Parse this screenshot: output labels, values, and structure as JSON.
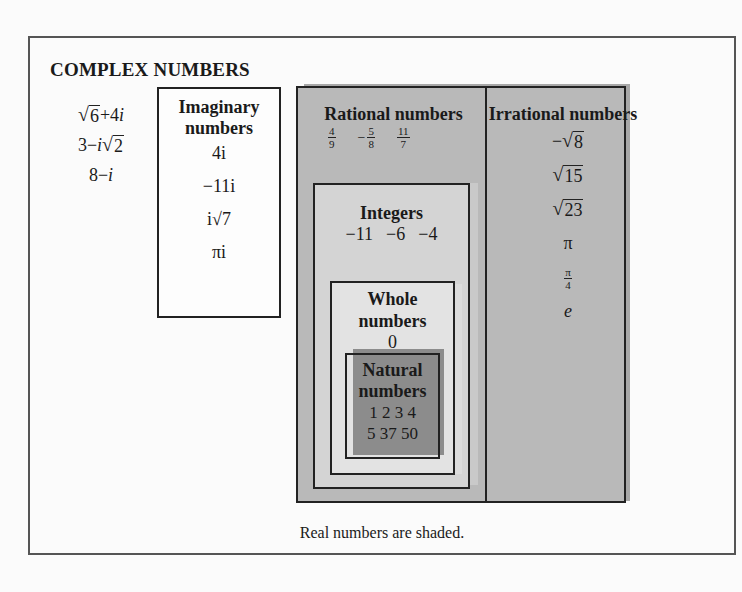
{
  "diagram": {
    "title": "COMPLEX NUMBERS",
    "caption": "Real numbers are shaded.",
    "complex_examples": [
      {
        "pre": "",
        "rad": "6",
        "post": "+4",
        "i": "i",
        "post2": ""
      },
      {
        "pre": "3−",
        "i": "i",
        "rad": "2"
      },
      {
        "text": "8−",
        "i": "i"
      }
    ],
    "imaginary": {
      "title_line1": "Imaginary",
      "title_line2": "numbers",
      "values": [
        "4i",
        "−11i",
        "i√7",
        "πi"
      ]
    },
    "rational": {
      "title": "Rational numbers",
      "fractions": [
        {
          "sign": "",
          "num": "4",
          "den": "9"
        },
        {
          "sign": "−",
          "num": "5",
          "den": "8"
        },
        {
          "sign": "",
          "num": "11",
          "den": "7"
        }
      ]
    },
    "irrational": {
      "title": "Irrational numbers",
      "values": [
        {
          "sign": "−",
          "rad": "8"
        },
        {
          "sign": "",
          "rad": "15"
        },
        {
          "sign": "",
          "rad": "23"
        },
        {
          "text": "π"
        },
        {
          "num": "π",
          "den": "4"
        },
        {
          "text": "e"
        }
      ]
    },
    "integers": {
      "title": "Integers",
      "values": "−11  −6  −4"
    },
    "whole": {
      "title_line1": "Whole",
      "title_line2": "numbers",
      "value": "0"
    },
    "natural": {
      "title_line1": "Natural",
      "title_line2": "numbers",
      "values_line1": "1 2 3 4",
      "values_line2": "5 37 50"
    },
    "colors": {
      "real_region": "#b9b9b9",
      "integers_region": "#d4d4d4",
      "whole_region": "#e3e3e3",
      "natural_region": "#8c8c8c",
      "border": "#222222"
    }
  }
}
